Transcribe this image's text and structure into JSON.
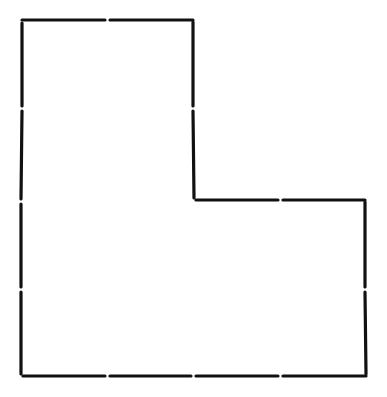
{
  "diagram": {
    "shape": "L-shaped polygon outline",
    "stroke_color": "#111111",
    "background": "#ffffff",
    "stroke_width": 3.2,
    "segment_gap": 5,
    "vertices": [
      [
        22,
        20
      ],
      [
        193,
        20
      ],
      [
        194,
        200
      ],
      [
        365,
        200
      ],
      [
        366,
        376
      ],
      [
        21,
        376
      ]
    ],
    "segments": [
      {
        "x1": 22,
        "y1": 20,
        "x2": 105,
        "y2": 20
      },
      {
        "x1": 110,
        "y1": 20,
        "x2": 193,
        "y2": 20
      },
      {
        "x1": 193,
        "y1": 22,
        "x2": 193,
        "y2": 106
      },
      {
        "x1": 193,
        "y1": 111,
        "x2": 194,
        "y2": 198
      },
      {
        "x1": 196,
        "y1": 200,
        "x2": 278,
        "y2": 200
      },
      {
        "x1": 283,
        "y1": 200,
        "x2": 365,
        "y2": 200
      },
      {
        "x1": 365,
        "y1": 202,
        "x2": 365,
        "y2": 287
      },
      {
        "x1": 365,
        "y1": 292,
        "x2": 366,
        "y2": 374
      },
      {
        "x1": 366,
        "y1": 376,
        "x2": 283,
        "y2": 376
      },
      {
        "x1": 278,
        "y1": 376,
        "x2": 196,
        "y2": 376
      },
      {
        "x1": 191,
        "y1": 376,
        "x2": 110,
        "y2": 376
      },
      {
        "x1": 105,
        "y1": 376,
        "x2": 23,
        "y2": 376
      },
      {
        "x1": 21,
        "y1": 374,
        "x2": 21,
        "y2": 292
      },
      {
        "x1": 21,
        "y1": 287,
        "x2": 21,
        "y2": 204
      },
      {
        "x1": 21,
        "y1": 199,
        "x2": 22,
        "y2": 111
      },
      {
        "x1": 22,
        "y1": 106,
        "x2": 22,
        "y2": 23
      }
    ]
  }
}
